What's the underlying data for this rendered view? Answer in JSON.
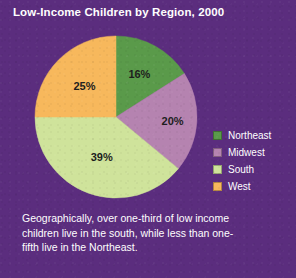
{
  "chart_data": {
    "type": "pie",
    "title": "Low-Income Children by Region, 2000",
    "categories": [
      "Northeast",
      "Midwest",
      "South",
      "West"
    ],
    "values": [
      16,
      20,
      39,
      25
    ],
    "value_labels": [
      "16%",
      "20%",
      "39%",
      "25%"
    ],
    "unit": "%",
    "colors": [
      "#5a9a4a",
      "#b583b0",
      "#cfe39b",
      "#f7b85c"
    ],
    "start_angle_deg": 0,
    "direction": "clockwise",
    "legend_position": "right",
    "grid": false,
    "xlabel": "",
    "ylabel": "",
    "annotations": [
      "Geographically, over one-third of low income children live in the south, while less than one-fifth live in the Northeast."
    ]
  },
  "title": "Low-Income Children by Region, 2000",
  "slices": [
    {
      "label": "Northeast",
      "value": 16,
      "value_label": "16%",
      "color": "#5a9a4a"
    },
    {
      "label": "Midwest",
      "value": 20,
      "value_label": "20%",
      "color": "#b583b0"
    },
    {
      "label": "South",
      "value": 39,
      "value_label": "39%",
      "color": "#cfe39b"
    },
    {
      "label": "West",
      "value": 25,
      "value_label": "25%",
      "color": "#f7b85c"
    }
  ],
  "legend": {
    "items": [
      {
        "label": "Northeast",
        "color": "#5a9a4a"
      },
      {
        "label": "Midwest",
        "color": "#b583b0"
      },
      {
        "label": "South",
        "color": "#cfe39b"
      },
      {
        "label": "West",
        "color": "#f7b85c"
      }
    ]
  },
  "caption": {
    "line1": "Geographically, over one-third of low income",
    "line2": "children live in the south, while less than one-",
    "line3": "fifth live in the Northeast."
  },
  "theme": {
    "background": "#5b2d7e",
    "title_color": "#ffffff",
    "caption_color": "#ffffff",
    "label_color": "#1d1d1d"
  }
}
